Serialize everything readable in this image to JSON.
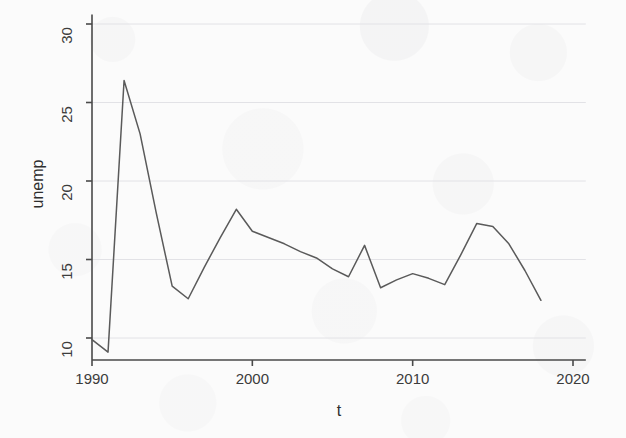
{
  "figure": {
    "background_color": "#fbfbfb",
    "line_color": "#5a5a5a",
    "axis_color": "#4a4a4a",
    "grid_color": "#e2e2e6",
    "width": 626,
    "height": 438
  },
  "axes": {
    "x_axis_label": "t",
    "y_axis_label": "unemp",
    "x_tick_labels": [
      "1990",
      "2000",
      "2010",
      "2020"
    ],
    "y_tick_labels": [
      "10",
      "15",
      "20",
      "25",
      "30"
    ]
  },
  "chart_data": {
    "type": "line",
    "title": "",
    "xlabel": "t",
    "ylabel": "unemp",
    "xlim": [
      1989.2,
      2020.8
    ],
    "ylim": [
      8.6,
      30.6
    ],
    "xticks": [
      1990,
      2000,
      2010,
      2020
    ],
    "yticks": [
      10,
      15,
      20,
      25,
      30
    ],
    "grid": true,
    "grid_axis": "y",
    "legend": false,
    "series": [
      {
        "name": "unemp",
        "x": [
          1990,
          1991,
          1992,
          1993,
          1994,
          1995,
          1996,
          1997,
          1998,
          1999,
          2000,
          2001,
          2002,
          2003,
          2004,
          2005,
          2006,
          2007,
          2008,
          2009,
          2010,
          2011,
          2012,
          2013,
          2014,
          2015,
          2016,
          2017,
          2018
        ],
        "values": [
          9.9,
          9.1,
          26.4,
          23.0,
          18.0,
          13.3,
          12.5,
          14.5,
          16.4,
          18.2,
          16.8,
          16.4,
          16.0,
          15.5,
          15.1,
          14.4,
          13.9,
          15.9,
          13.2,
          13.7,
          14.1,
          13.8,
          13.4,
          15.3,
          17.3,
          17.1,
          16.0,
          14.3,
          12.4
        ]
      }
    ]
  }
}
